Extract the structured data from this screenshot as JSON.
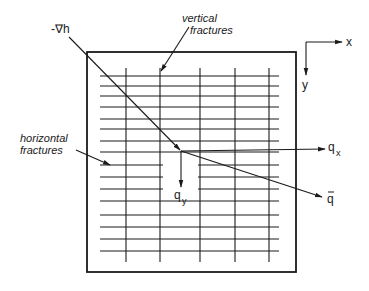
{
  "diagram": {
    "labels": {
      "grad_h": "-∇h",
      "vertical_line1": "vertical",
      "vertical_line2": "fractures",
      "horizontal_line1": "horizontal",
      "horizontal_line2": "fractures",
      "qx_main": "q",
      "qx_sub": "x",
      "qy_main": "q",
      "qy_sub": "y",
      "q_vector": "q",
      "q_vector_bar": "→",
      "axis_x": "x",
      "axis_y": "y"
    },
    "colors": {
      "ink": "#1a1a1a",
      "background": "#ffffff"
    }
  }
}
